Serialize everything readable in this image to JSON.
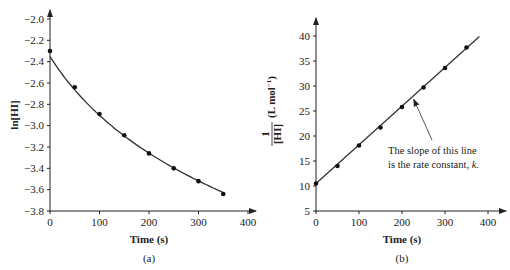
{
  "chart_data": [
    {
      "id": "a",
      "type": "line",
      "caption": "(a)",
      "title": "",
      "xlabel": "Time (s)",
      "ylabel": "ln[HI]",
      "xlim": [
        0,
        400
      ],
      "ylim": [
        -3.8,
        -2.0
      ],
      "xticks": [
        "0",
        "100",
        "200",
        "300",
        "400"
      ],
      "yticks": [
        "-2.0",
        "-2.2",
        "-2.4",
        "-2.6",
        "-2.8",
        "-3.0",
        "-3.2",
        "-3.4",
        "-3.6",
        "-3.8"
      ],
      "grid": false,
      "legend": null,
      "series": [
        {
          "name": "ln[HI]",
          "x": [
            0,
            50,
            100,
            150,
            200,
            250,
            300,
            350
          ],
          "y": [
            -2.3,
            -2.64,
            -2.89,
            -3.09,
            -3.26,
            -3.4,
            -3.52,
            -3.64
          ]
        }
      ]
    },
    {
      "id": "b",
      "type": "line",
      "caption": "(b)",
      "title": "",
      "xlabel": "Time (s)",
      "ylabel": "1/[HI] (L mol⁻¹)",
      "xlim": [
        0,
        400
      ],
      "ylim": [
        5,
        40
      ],
      "xticks": [
        "0",
        "100",
        "200",
        "300",
        "400"
      ],
      "yticks": [
        "5",
        "10",
        "15",
        "20",
        "25",
        "30",
        "35",
        "40"
      ],
      "grid": false,
      "legend": null,
      "series": [
        {
          "name": "1/[HI]",
          "x": [
            0,
            50,
            100,
            150,
            200,
            250,
            300,
            350
          ],
          "y": [
            10.5,
            14.0,
            18.1,
            21.7,
            25.8,
            29.7,
            33.6,
            37.7
          ]
        }
      ],
      "annotations": [
        {
          "text_line1": "The slope of this line",
          "text_line2": "is the rate constant, ",
          "text_k": "k",
          "text_end": ".",
          "points_to_x": 225
        }
      ]
    }
  ]
}
